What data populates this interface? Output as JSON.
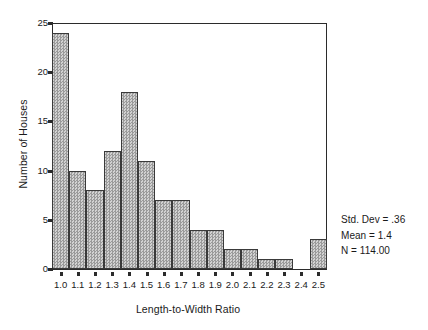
{
  "chart_data": {
    "type": "bar",
    "title": "",
    "subtitle": "",
    "xlabel": "Length-to-Width Ratio",
    "ylabel": "Number of Houses",
    "categories": [
      "1.0",
      "1.1",
      "1.2",
      "1.3",
      "1.4",
      "1.5",
      "1.6",
      "1.7",
      "1.8",
      "1.9",
      "2.0",
      "2.1",
      "2.2",
      "2.3",
      "2.4",
      "2.5"
    ],
    "values": [
      24,
      10,
      8,
      12,
      18,
      11,
      7,
      7,
      4,
      4,
      2,
      2,
      1,
      1,
      0,
      3
    ],
    "ylim": [
      0,
      25
    ],
    "yticks": [
      0,
      5,
      10,
      15,
      20,
      25
    ],
    "ytick_labels": [
      "0",
      "5",
      "10",
      "15",
      "20",
      "25"
    ],
    "grid": false,
    "legend": false,
    "bar_color": "#b4b4b4",
    "bar_edge_color": "#3a3a3a",
    "axis_color": "#2b2b2b"
  },
  "annotations": {
    "std_dev": "Std. Dev = .36",
    "mean": "Mean = 1.4",
    "n": "N = 114.00"
  }
}
